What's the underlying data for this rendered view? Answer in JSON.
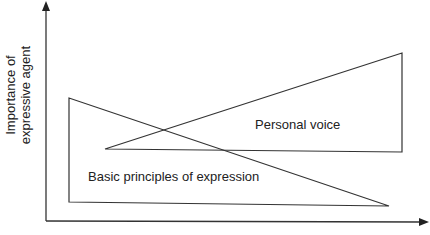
{
  "diagram": {
    "y_axis_label_line1": "Importance of",
    "y_axis_label_line2": "expressive agent",
    "x_axis_label": "",
    "shapes": [
      {
        "name": "Personal voice",
        "type": "wedge-widening-right"
      },
      {
        "name": "Basic principles of expression",
        "type": "wedge-narrowing-right"
      }
    ],
    "labels": {
      "personal_voice": "Personal voice",
      "basic_principles": "Basic principles of expression"
    },
    "colors": {
      "stroke": "#333333",
      "background": "#ffffff",
      "text": "#222222"
    }
  }
}
